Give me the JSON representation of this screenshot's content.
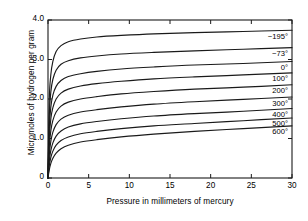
{
  "chart_data": {
    "type": "line",
    "title": "",
    "xlabel": "Pressure in millimeters of mercury",
    "ylabel": "Micromoles of hydrogen per gram",
    "xlim": [
      0,
      30
    ],
    "ylim": [
      0,
      4.0
    ],
    "xticks": [
      0,
      5,
      10,
      15,
      20,
      25,
      30
    ],
    "xtick_labels": [
      "0",
      "5",
      "10",
      "15",
      "20",
      "25",
      "30"
    ],
    "yticks": [
      0,
      1.0,
      2.0,
      3.0,
      4.0
    ],
    "ytick_labels": [
      "0",
      "1.0",
      "2.0",
      "3.0",
      "4.0"
    ],
    "grid": false,
    "legend_position": "inline-right",
    "line_color": "#1a1a1a",
    "frame_color": "#1a1a1a",
    "background": "#ffffff",
    "series": [
      {
        "name": "-195°",
        "label": "−195°",
        "x": [
          0,
          0.15,
          0.35,
          0.6,
          1.0,
          1.6,
          2.5,
          4.0,
          6.0,
          9.0,
          13.0,
          18.0,
          24.0,
          30.0
        ],
        "values": [
          0.0,
          1.95,
          2.62,
          2.95,
          3.2,
          3.35,
          3.45,
          3.52,
          3.57,
          3.61,
          3.65,
          3.68,
          3.71,
          3.74
        ]
      },
      {
        "name": "-73°",
        "label": "−73°",
        "x": [
          0,
          0.15,
          0.35,
          0.6,
          1.0,
          1.6,
          2.5,
          4.0,
          6.0,
          9.0,
          13.0,
          18.0,
          24.0,
          30.0
        ],
        "values": [
          0.0,
          1.55,
          2.18,
          2.5,
          2.73,
          2.88,
          2.97,
          3.04,
          3.09,
          3.14,
          3.18,
          3.22,
          3.26,
          3.3
        ]
      },
      {
        "name": "0°",
        "label": "0°",
        "x": [
          0,
          0.15,
          0.35,
          0.6,
          1.0,
          1.6,
          2.5,
          4.0,
          6.0,
          9.0,
          13.0,
          18.0,
          24.0,
          30.0
        ],
        "values": [
          0.0,
          1.25,
          1.8,
          2.1,
          2.32,
          2.47,
          2.57,
          2.64,
          2.7,
          2.76,
          2.81,
          2.86,
          2.9,
          2.95
        ]
      },
      {
        "name": "100°",
        "label": "100°",
        "x": [
          0,
          0.15,
          0.35,
          0.6,
          1.0,
          1.6,
          2.5,
          4.0,
          6.0,
          9.0,
          13.0,
          18.0,
          24.0,
          30.0
        ],
        "values": [
          0.0,
          1.0,
          1.5,
          1.78,
          2.0,
          2.15,
          2.25,
          2.33,
          2.39,
          2.45,
          2.51,
          2.56,
          2.61,
          2.66
        ]
      },
      {
        "name": "200°",
        "label": "200°",
        "x": [
          0,
          0.15,
          0.35,
          0.6,
          1.0,
          1.6,
          2.5,
          4.0,
          6.0,
          9.0,
          13.0,
          18.0,
          24.0,
          30.0
        ],
        "values": [
          0.0,
          0.78,
          1.2,
          1.46,
          1.67,
          1.82,
          1.92,
          2.0,
          2.06,
          2.13,
          2.19,
          2.25,
          2.3,
          2.36
        ]
      },
      {
        "name": "300°",
        "label": "300°",
        "x": [
          0,
          0.15,
          0.35,
          0.6,
          1.0,
          1.6,
          2.5,
          4.0,
          6.0,
          9.0,
          13.0,
          18.0,
          24.0,
          30.0
        ],
        "values": [
          0.0,
          0.58,
          0.93,
          1.16,
          1.35,
          1.49,
          1.59,
          1.67,
          1.73,
          1.8,
          1.87,
          1.93,
          1.99,
          2.05
        ]
      },
      {
        "name": "400°",
        "label": "400°",
        "x": [
          0,
          0.15,
          0.35,
          0.6,
          1.0,
          1.6,
          2.5,
          4.0,
          6.0,
          9.0,
          13.0,
          18.0,
          24.0,
          30.0
        ],
        "values": [
          0.0,
          0.42,
          0.7,
          0.89,
          1.06,
          1.19,
          1.29,
          1.37,
          1.43,
          1.5,
          1.57,
          1.63,
          1.69,
          1.76
        ]
      },
      {
        "name": "500°",
        "label": "500°",
        "x": [
          0,
          0.15,
          0.35,
          0.6,
          1.0,
          1.6,
          2.5,
          4.0,
          6.0,
          9.0,
          13.0,
          18.0,
          24.0,
          30.0
        ],
        "values": [
          0.0,
          0.3,
          0.52,
          0.68,
          0.83,
          0.95,
          1.04,
          1.12,
          1.18,
          1.25,
          1.32,
          1.38,
          1.45,
          1.52
        ]
      },
      {
        "name": "600°",
        "label": "600°",
        "x": [
          0,
          0.15,
          0.35,
          0.6,
          1.0,
          1.6,
          2.5,
          4.0,
          6.0,
          9.0,
          13.0,
          18.0,
          24.0,
          30.0
        ],
        "values": [
          0.0,
          0.2,
          0.37,
          0.5,
          0.63,
          0.74,
          0.83,
          0.91,
          0.97,
          1.04,
          1.11,
          1.18,
          1.25,
          1.32
        ]
      }
    ]
  }
}
